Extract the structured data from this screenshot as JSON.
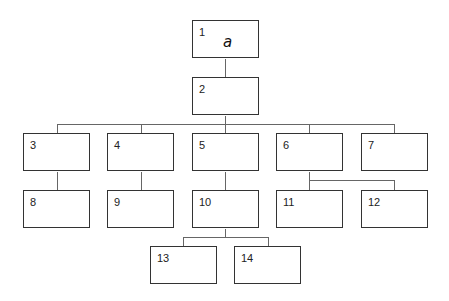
{
  "diagram": {
    "type": "hierarchy-tree",
    "line_color": "#666666",
    "box_border_color": "#333333",
    "nodes": [
      {
        "id": "1",
        "label": "1",
        "symbol": "a",
        "parent": null
      },
      {
        "id": "2",
        "label": "2",
        "parent": "1"
      },
      {
        "id": "3",
        "label": "3",
        "parent": "2"
      },
      {
        "id": "4",
        "label": "4",
        "parent": "2"
      },
      {
        "id": "5",
        "label": "5",
        "parent": "2"
      },
      {
        "id": "6",
        "label": "6",
        "parent": "2"
      },
      {
        "id": "7",
        "label": "7",
        "parent": "2"
      },
      {
        "id": "8",
        "label": "8",
        "parent": "3"
      },
      {
        "id": "9",
        "label": "9",
        "parent": "4"
      },
      {
        "id": "10",
        "label": "10",
        "parent": "5"
      },
      {
        "id": "11",
        "label": "11",
        "parent": "6"
      },
      {
        "id": "12",
        "label": "12",
        "parent": "6"
      },
      {
        "id": "13",
        "label": "13",
        "parent": "10"
      },
      {
        "id": "14",
        "label": "14",
        "parent": "10"
      }
    ]
  }
}
